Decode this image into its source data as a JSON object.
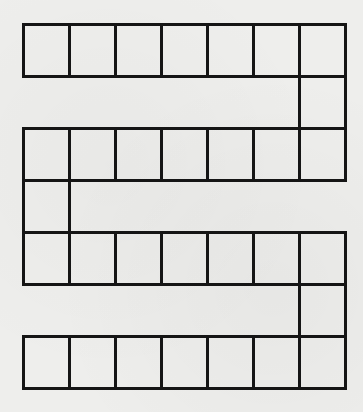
{
  "diagram": {
    "type": "serpentine-board-path",
    "line_color": "#151515",
    "background_color": "#eeeeec",
    "columns": 7,
    "cell_size": 46,
    "origin": [
      22,
      23
    ],
    "rows": [
      {
        "name": "row-1",
        "grid_row": 0,
        "cols": [
          0,
          1,
          2,
          3,
          4,
          5,
          6
        ]
      },
      {
        "name": "connector-1",
        "grid_row": 1,
        "cols": [
          6
        ]
      },
      {
        "name": "row-2",
        "grid_row": 2,
        "cols": [
          0,
          1,
          2,
          3,
          4,
          5,
          6
        ]
      },
      {
        "name": "connector-2",
        "grid_row": 3,
        "cols": [
          0
        ]
      },
      {
        "name": "row-3",
        "grid_row": 4,
        "cols": [
          0,
          1,
          2,
          3,
          4,
          5,
          6
        ]
      },
      {
        "name": "connector-3",
        "grid_row": 5,
        "cols": [
          6
        ]
      },
      {
        "name": "row-4",
        "grid_row": 6,
        "cols": [
          0,
          1,
          2,
          3,
          4,
          5,
          6
        ]
      }
    ],
    "total_cells": 31
  }
}
